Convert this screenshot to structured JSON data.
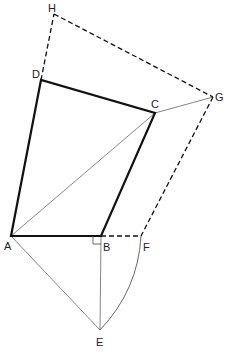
{
  "diagram": {
    "type": "geometric-construction",
    "points": {
      "A": {
        "label": "A",
        "x": 11,
        "y": 236,
        "lx": 4,
        "ly": 250
      },
      "B": {
        "label": "B",
        "x": 101,
        "y": 236,
        "lx": 103,
        "ly": 251
      },
      "C": {
        "label": "C",
        "x": 155,
        "y": 113,
        "lx": 151,
        "ly": 108
      },
      "D": {
        "label": "D",
        "x": 41,
        "y": 80,
        "lx": 32,
        "ly": 78
      },
      "E": {
        "label": "E",
        "x": 100,
        "y": 330,
        "lx": 96,
        "ly": 346
      },
      "F": {
        "label": "F",
        "x": 141,
        "y": 236,
        "lx": 143,
        "ly": 251
      },
      "G": {
        "label": "G",
        "x": 213,
        "y": 97,
        "lx": 215,
        "ly": 101
      },
      "H": {
        "label": "H",
        "x": 54,
        "y": 14,
        "lx": 48,
        "ly": 12
      }
    },
    "segments": {
      "thick": [
        [
          "A",
          "B"
        ],
        [
          "B",
          "C"
        ],
        [
          "C",
          "D"
        ],
        [
          "D",
          "A"
        ]
      ],
      "thin": [
        [
          "A",
          "C"
        ],
        [
          "C",
          "G"
        ],
        [
          "A",
          "E"
        ],
        [
          "B",
          "E"
        ]
      ],
      "dashed": [
        [
          "D",
          "H"
        ],
        [
          "H",
          "G"
        ],
        [
          "G",
          "F"
        ],
        [
          "B",
          "F"
        ]
      ],
      "arc": [
        [
          "E",
          "F"
        ]
      ]
    },
    "right_angle_marker": "B",
    "colors": {
      "stroke": "#111111",
      "thin": "#555555",
      "label": "#222222"
    }
  }
}
